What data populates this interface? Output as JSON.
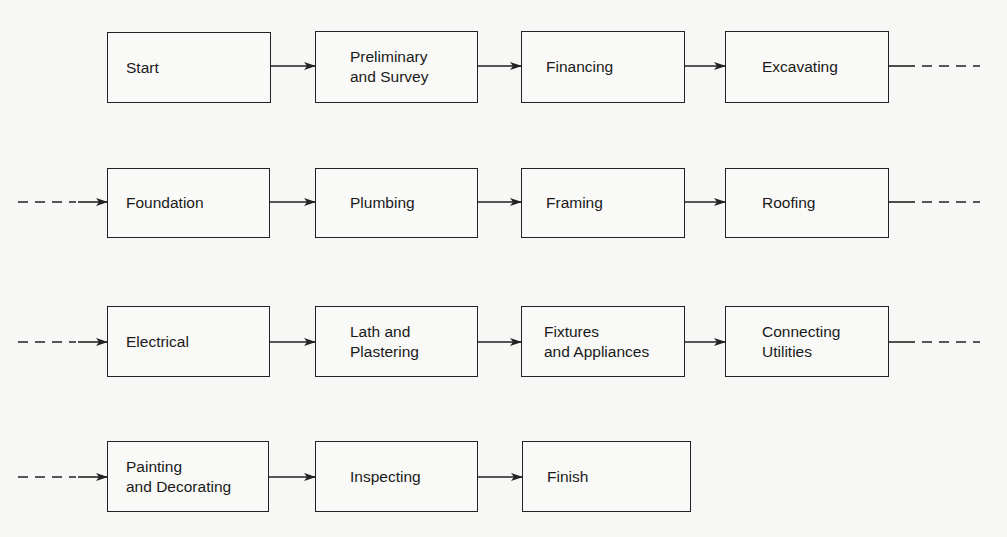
{
  "diagram": {
    "type": "flowchart",
    "title": "",
    "rows": [
      {
        "steps": [
          "Start",
          "Preliminary\nand Survey",
          "Financing",
          "Excavating"
        ],
        "continues_left": false,
        "continues_right": true
      },
      {
        "steps": [
          "Foundation",
          "Plumbing",
          "Framing",
          "Roofing"
        ],
        "continues_left": true,
        "continues_right": true
      },
      {
        "steps": [
          "Electrical",
          "Lath and\nPlastering",
          "Fixtures\nand Appliances",
          "Connecting\nUtilities"
        ],
        "continues_left": true,
        "continues_right": true
      },
      {
        "steps": [
          "Painting\nand Decorating",
          "Inspecting",
          "Finish"
        ],
        "continues_left": true,
        "continues_right": false
      }
    ]
  },
  "nodes": {
    "start": "Start",
    "preliminary_survey": "Preliminary\nand Survey",
    "financing": "Financing",
    "excavating": "Excavating",
    "foundation": "Foundation",
    "plumbing": "Plumbing",
    "framing": "Framing",
    "roofing": "Roofing",
    "electrical": "Electrical",
    "lath_plastering": "Lath and\nPlastering",
    "fixtures_appliances": "Fixtures\nand Appliances",
    "connecting_utilities": "Connecting\nUtilities",
    "painting_decorating": "Painting\nand Decorating",
    "inspecting": "Inspecting",
    "finish": "Finish"
  },
  "colors": {
    "line": "#222222",
    "background": "#f7f7f5"
  }
}
